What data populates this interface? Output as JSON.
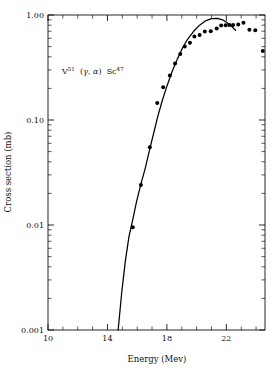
{
  "chart_data": {
    "type": "scatter",
    "title": "",
    "annotation": "V51 (gamma, alpha) Sc47",
    "annotation_parts": {
      "target": "V",
      "target_mass": "51",
      "reaction_open": "(",
      "incoming": "γ",
      "comma": ", ",
      "outgoing": "α",
      "reaction_close": ")",
      "product": "Sc",
      "product_mass": "47"
    },
    "xlabel": "Energy  (Mev)",
    "ylabel": "Cross section (mb)",
    "xscale": "linear",
    "yscale": "log",
    "xlim": [
      10,
      24.6
    ],
    "ylim": [
      0.001,
      1.0
    ],
    "grid": false,
    "legend": "none",
    "xticks_major": [
      10,
      14,
      18,
      22
    ],
    "xtick_labels": [
      "10",
      "14",
      "18",
      "22"
    ],
    "xticks_minor": [
      11,
      12,
      13,
      15,
      16,
      17,
      19,
      20,
      21,
      23,
      24
    ],
    "yticks_major": [
      1.0,
      0.1,
      0.01,
      0.001
    ],
    "ytick_labels": [
      "1.00",
      "0.10",
      "0.01",
      "0.001"
    ],
    "series": [
      {
        "name": "measured cross section",
        "type": "scatter",
        "marker": "filled-circle",
        "color": "#000000",
        "points": [
          [
            15.7,
            0.0095
          ],
          [
            16.25,
            0.024
          ],
          [
            16.85,
            0.055
          ],
          [
            17.35,
            0.145
          ],
          [
            17.75,
            0.205
          ],
          [
            18.2,
            0.265
          ],
          [
            18.55,
            0.345
          ],
          [
            18.9,
            0.425
          ],
          [
            19.2,
            0.5
          ],
          [
            19.55,
            0.545
          ],
          [
            19.85,
            0.625
          ],
          [
            20.2,
            0.645
          ],
          [
            20.55,
            0.695
          ],
          [
            20.95,
            0.7
          ],
          [
            21.35,
            0.745
          ],
          [
            21.65,
            0.795
          ],
          [
            21.95,
            0.8
          ],
          [
            22.2,
            0.805
          ],
          [
            22.45,
            0.805
          ],
          [
            22.8,
            0.81
          ],
          [
            23.15,
            0.845
          ],
          [
            23.55,
            0.725
          ],
          [
            23.95,
            0.715
          ],
          [
            24.45,
            0.455
          ]
        ]
      },
      {
        "name": "theoretical curve",
        "type": "line",
        "color": "#000000",
        "points": [
          [
            14.72,
            0.001
          ],
          [
            14.95,
            0.0022
          ],
          [
            15.2,
            0.0045
          ],
          [
            15.45,
            0.0078
          ],
          [
            15.7,
            0.0112
          ],
          [
            15.95,
            0.0165
          ],
          [
            16.25,
            0.0245
          ],
          [
            16.55,
            0.035
          ],
          [
            16.85,
            0.053
          ],
          [
            17.15,
            0.079
          ],
          [
            17.4,
            0.11
          ],
          [
            17.7,
            0.155
          ],
          [
            18.0,
            0.21
          ],
          [
            18.35,
            0.29
          ],
          [
            18.7,
            0.38
          ],
          [
            19.05,
            0.485
          ],
          [
            19.4,
            0.59
          ],
          [
            19.8,
            0.7
          ],
          [
            20.2,
            0.8
          ],
          [
            20.6,
            0.88
          ],
          [
            21.0,
            0.925
          ],
          [
            21.4,
            0.93
          ],
          [
            21.75,
            0.9
          ],
          [
            22.05,
            0.845
          ],
          [
            22.35,
            0.78
          ],
          [
            22.62,
            0.715
          ]
        ]
      }
    ]
  },
  "figure": {
    "plot_left": 48,
    "plot_right": 265,
    "plot_top": 15,
    "plot_bottom": 330
  }
}
